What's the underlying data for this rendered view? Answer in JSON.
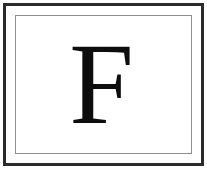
{
  "card": {
    "letter": "F",
    "letter_name": "capital-letter-f",
    "background_color": "#ffffff",
    "outer_border_color": "#2b2b2b",
    "outer_border_width_px": "3",
    "inner_border_color": "#8e8e8e",
    "inner_border_width_px": "1",
    "glyph_color": "#0d0d0d",
    "glyph_font_size_px": "116",
    "glyph_style": "serif"
  }
}
